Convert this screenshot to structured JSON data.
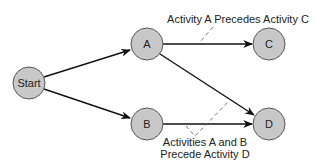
{
  "diagram": {
    "type": "activity-on-node precedence network",
    "colors": {
      "node_fill": "#c8c8c8",
      "node_stroke": "#555555",
      "edge": "#111111",
      "dashed_leader": "#666666",
      "text": "#222222"
    },
    "nodes": [
      {
        "id": "start",
        "label": "Start"
      },
      {
        "id": "a",
        "label": "A"
      },
      {
        "id": "b",
        "label": "B"
      },
      {
        "id": "c",
        "label": "C"
      },
      {
        "id": "d",
        "label": "D"
      }
    ],
    "edges": [
      {
        "from": "Start",
        "to": "A"
      },
      {
        "from": "Start",
        "to": "B"
      },
      {
        "from": "A",
        "to": "C"
      },
      {
        "from": "A",
        "to": "D"
      },
      {
        "from": "B",
        "to": "D"
      }
    ],
    "annotations": {
      "a_precedes_c": "Activity A Precedes Activity C",
      "ab_precede_d_line1": "Activities A and B",
      "ab_precede_d_line2": "Precede Activity D"
    }
  }
}
